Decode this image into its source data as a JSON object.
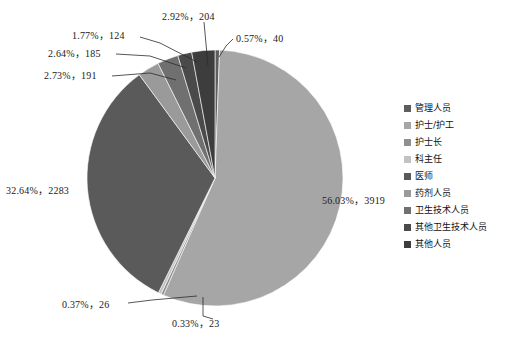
{
  "chart_data": {
    "type": "pie",
    "title": "",
    "total": 6995,
    "legend_position": "right",
    "start_angle_deg": 0,
    "direction": "clockwise",
    "categories": [
      "管理人员",
      "护士/护工",
      "护士长",
      "科主任",
      "医师",
      "药剂人员",
      "卫生技术人员",
      "其他卫生技术人员",
      "其他人员"
    ],
    "values": [
      40,
      3919,
      23,
      26,
      2283,
      191,
      185,
      124,
      204
    ],
    "percents": [
      0.57,
      56.03,
      0.33,
      0.37,
      32.64,
      2.73,
      2.64,
      1.77,
      2.92
    ],
    "colors": [
      "#5d5d5d",
      "#a6a6a6",
      "#8f8f8f",
      "#c2c2c2",
      "#5a5a5a",
      "#9a9a9a",
      "#707070",
      "#4a4a4a",
      "#3d3d3d"
    ],
    "slices": [
      {
        "label": "管理人员",
        "value": 40,
        "percent": 0.57,
        "color": "#5d5d5d",
        "data_label": "0.57%，40"
      },
      {
        "label": "护士/护工",
        "value": 3919,
        "percent": 56.03,
        "color": "#a6a6a6",
        "data_label": "56.03%，3919"
      },
      {
        "label": "护士长",
        "value": 23,
        "percent": 0.33,
        "color": "#8f8f8f",
        "data_label": "0.33%，23"
      },
      {
        "label": "科主任",
        "value": 26,
        "percent": 0.37,
        "color": "#c2c2c2",
        "data_label": "0.37%，26"
      },
      {
        "label": "医师",
        "value": 2283,
        "percent": 32.64,
        "color": "#5a5a5a",
        "data_label": "32.64%，2283"
      },
      {
        "label": "药剂人员",
        "value": 191,
        "percent": 2.73,
        "color": "#9a9a9a",
        "data_label": "2.73%，191"
      },
      {
        "label": "卫生技术人员",
        "value": 185,
        "percent": 2.64,
        "color": "#707070",
        "data_label": "2.64%，185"
      },
      {
        "label": "其他卫生技术人员",
        "value": 124,
        "percent": 1.77,
        "color": "#4a4a4a",
        "data_label": "1.77%，124"
      },
      {
        "label": "其他人员",
        "value": 204,
        "percent": 2.92,
        "color": "#3d3d3d",
        "data_label": "2.92%，204"
      }
    ]
  },
  "data_labels": {
    "guanli": "0.57%，40",
    "hushi_hugong": "56.03%，3919",
    "hushizhang": "0.33%，23",
    "kezhuren": "0.37%，26",
    "yishi": "32.64%，2283",
    "yaoji": "2.73%，191",
    "weisheng_jishu": "2.64%，185",
    "qita_weisheng_jishu": "1.77%，124",
    "qita_renyuan": "2.92%，204"
  },
  "legend": {
    "items": [
      {
        "label": "管理人员",
        "color": "#5d5d5d"
      },
      {
        "label": "护士/护工",
        "color": "#a6a6a6"
      },
      {
        "label": "护士长",
        "color": "#8f8f8f"
      },
      {
        "label": "科主任",
        "color": "#c2c2c2"
      },
      {
        "label": "医师",
        "color": "#5a5a5a"
      },
      {
        "label": "药剂人员",
        "color": "#9a9a9a"
      },
      {
        "label": "卫生技术人员",
        "color": "#707070"
      },
      {
        "label": "其他卫生技术人员",
        "color": "#4a4a4a"
      },
      {
        "label": "其他人员",
        "color": "#3d3d3d"
      }
    ]
  },
  "geometry": {
    "cx": 215,
    "cy": 178,
    "r": 128
  }
}
